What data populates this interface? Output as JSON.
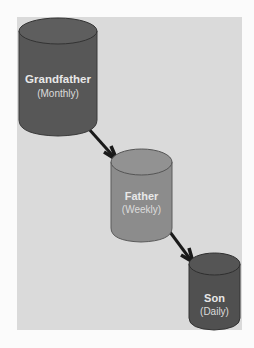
{
  "diagram": {
    "nodes": [
      {
        "id": "grandfather",
        "label": "Grandfather",
        "sublabel": "(Monthly)",
        "color": "#575757"
      },
      {
        "id": "father",
        "label": "Father",
        "sublabel": "(Weekly)",
        "color": "#8c8c8c"
      },
      {
        "id": "son",
        "label": "Son",
        "sublabel": "(Daily)",
        "color": "#505050"
      }
    ],
    "edges": [
      {
        "from": "grandfather",
        "to": "father"
      },
      {
        "from": "father",
        "to": "son"
      }
    ],
    "colors": {
      "panel": "#dadada",
      "arrow": "#1a1a1a",
      "label": "#e8e8e8"
    }
  }
}
